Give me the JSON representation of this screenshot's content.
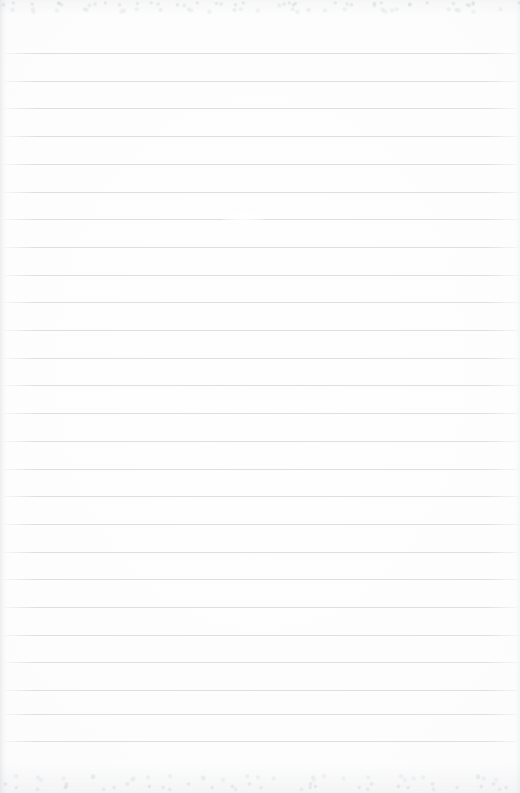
{
  "document": {
    "type": "blank-ruled-notebook-paper-scan",
    "width_px": 520,
    "height_px": 793,
    "written_content": "",
    "has_text": false,
    "has_margin_rule": false,
    "has_holes": false
  },
  "paper": {
    "background_color": "#fdfdfd",
    "edge_tint_color": "#f4f5f6",
    "noise_color": "#b4b9be"
  },
  "ruling": {
    "line_color": "#d9dde0",
    "line_thickness_px": 1,
    "line_spacing_px": 27.7,
    "first_line_y_px": 53,
    "last_line_y_px": 741,
    "line_start_x_px": 3,
    "line_end_x_px": 518,
    "line_count": 26,
    "line_y_positions": [
      53,
      80.7,
      108.4,
      136.1,
      163.8,
      191.5,
      219.2,
      246.9,
      274.6,
      302.3,
      330,
      357.7,
      385.4,
      413.1,
      440.8,
      468.5,
      496.2,
      523.9,
      551.6,
      579.3,
      607,
      634.7,
      662.4,
      690.1,
      713.6,
      741.3
    ]
  },
  "artifacts": {
    "top_noise_band": {
      "y_px": 0,
      "height_px": 16
    },
    "bottom_noise_band": {
      "y_px": 763,
      "height_px": 30
    },
    "left_edge_shadow": {
      "x_px": 0,
      "width_px": 9
    },
    "right_edge_shadow": {
      "x_px": 513,
      "width_px": 7
    },
    "smudge": {
      "x_px": 222,
      "y_px": 211,
      "width_px": 42,
      "height_px": 14
    }
  }
}
